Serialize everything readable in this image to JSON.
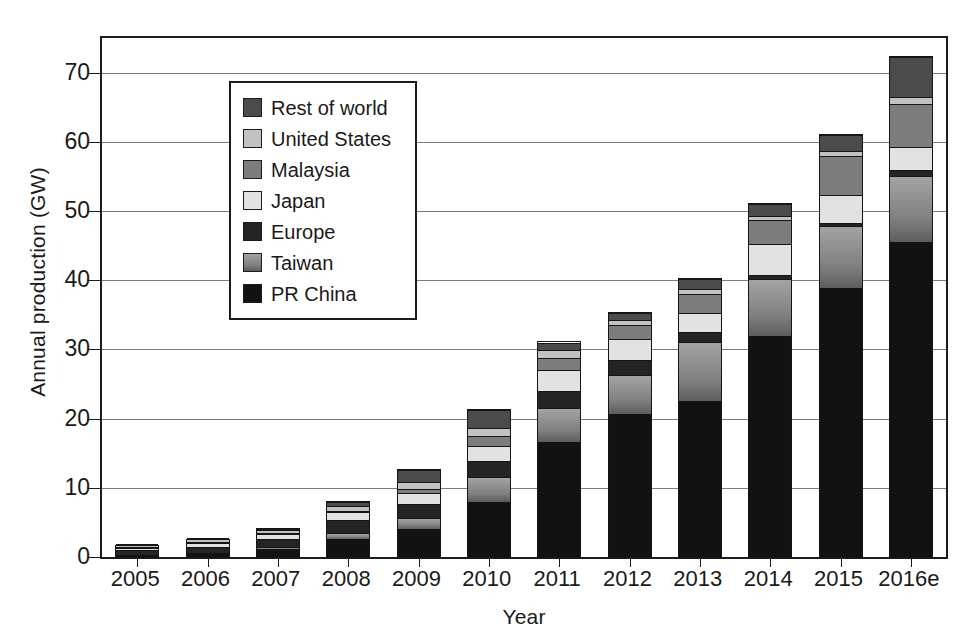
{
  "chart_data": {
    "type": "bar",
    "stacked": true,
    "title": "",
    "xlabel": "Year",
    "ylabel": "Annual production (GW)",
    "ylim": [
      0,
      75
    ],
    "yticks": [
      0,
      10,
      20,
      30,
      40,
      50,
      60,
      70
    ],
    "ytick_labels": [
      "0",
      "10",
      "20",
      "30",
      "40",
      "50",
      "60",
      "70"
    ],
    "grid": true,
    "legend_position": "upper left",
    "categories": [
      "2005",
      "2006",
      "2007",
      "2008",
      "2009",
      "2010",
      "2011",
      "2012",
      "2013",
      "2014",
      "2015",
      "2016e"
    ],
    "series": [
      {
        "name": "PR China",
        "color": "#121212",
        "values": [
          0.2,
          0.4,
          1.1,
          2.6,
          4.0,
          8.0,
          16.6,
          20.7,
          22.6,
          32.0,
          38.9,
          45.5
        ]
      },
      {
        "name": "Taiwan",
        "color": "#8a8a8a",
        "values": [
          0.1,
          0.2,
          0.4,
          0.8,
          1.6,
          3.5,
          4.9,
          5.6,
          8.4,
          8.2,
          8.9,
          9.5
        ]
      },
      {
        "name": "Europe",
        "color": "#242424",
        "values": [
          0.6,
          0.9,
          1.1,
          1.9,
          2.0,
          2.4,
          2.5,
          2.2,
          1.5,
          0.5,
          0.4,
          1.0
        ]
      },
      {
        "name": "Japan",
        "color": "#e2e2e2",
        "values": [
          0.4,
          0.6,
          0.7,
          1.2,
          1.6,
          2.2,
          3.0,
          3.0,
          2.8,
          4.5,
          4.1,
          3.2
        ]
      },
      {
        "name": "Malaysia",
        "color": "#7d7d7d",
        "values": [
          0.0,
          0.0,
          0.1,
          0.2,
          0.7,
          1.4,
          1.7,
          2.0,
          2.7,
          3.5,
          5.7,
          6.3
        ]
      },
      {
        "name": "United States",
        "color": "#c2c2c2",
        "values": [
          0.2,
          0.3,
          0.4,
          0.7,
          1.0,
          1.1,
          1.2,
          0.7,
          0.8,
          0.6,
          0.7,
          1.0
        ]
      },
      {
        "name": "Rest of world",
        "color": "#4b4b4b",
        "values": [
          0.1,
          0.1,
          0.2,
          0.6,
          1.7,
          2.6,
          1.1,
          1.0,
          1.4,
          1.7,
          2.3,
          5.8
        ]
      }
    ],
    "totals": [
      1.6,
      2.5,
      4.0,
      8.0,
      12.6,
      21.2,
      31.0,
      35.2,
      40.2,
      51.0,
      61.0,
      72.3
    ]
  },
  "legend": {
    "entries": [
      {
        "label": "Rest of world",
        "swatch": "f-row"
      },
      {
        "label": "United States",
        "swatch": "f-us"
      },
      {
        "label": "Malaysia",
        "swatch": "f-malaysia"
      },
      {
        "label": "Japan",
        "swatch": "f-japan"
      },
      {
        "label": "Europe",
        "swatch": "f-europe"
      },
      {
        "label": "Taiwan",
        "swatch": "f-taiwan"
      },
      {
        "label": "PR China",
        "swatch": "f-china"
      }
    ]
  }
}
